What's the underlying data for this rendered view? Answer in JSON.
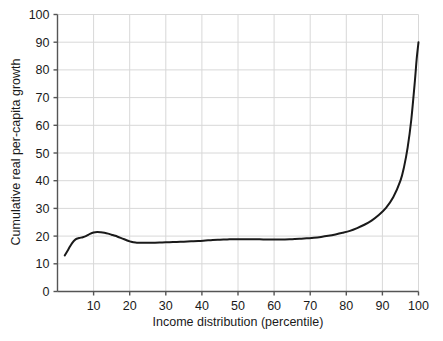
{
  "chart_data": {
    "type": "line",
    "title": "",
    "xlabel": "Income distribution (percentile)",
    "ylabel": "Cumulative real per-capita growth",
    "xlim": [
      0,
      100
    ],
    "ylim": [
      0,
      100
    ],
    "xticks": [
      10,
      20,
      30,
      40,
      50,
      60,
      70,
      80,
      90,
      100
    ],
    "yticks": [
      0,
      10,
      20,
      30,
      40,
      50,
      60,
      70,
      80,
      90,
      100
    ],
    "grid": true,
    "legend": "none",
    "line_color": "#1a1a1a",
    "grid_color": "#d8d8d8",
    "axis_color": "#555555",
    "background": "#ffffff",
    "series": [
      {
        "name": "Cumulative real per-capita growth",
        "x": [
          2,
          3,
          4,
          5,
          6,
          7,
          8,
          9,
          10,
          11,
          12,
          13,
          14,
          15,
          16,
          17,
          18,
          19,
          20,
          21,
          22,
          23,
          24,
          25,
          27,
          29,
          31,
          33,
          35,
          37,
          39,
          41,
          43,
          45,
          47,
          49,
          51,
          53,
          55,
          57,
          59,
          61,
          63,
          65,
          67,
          69,
          71,
          73,
          75,
          77,
          79,
          81,
          83,
          85,
          87,
          89,
          91,
          93,
          95,
          96,
          97,
          98,
          99,
          99.5,
          100
        ],
        "values": [
          13.0,
          15.2,
          17.4,
          18.8,
          19.3,
          19.6,
          20.1,
          20.8,
          21.3,
          21.5,
          21.4,
          21.2,
          20.9,
          20.5,
          20.1,
          19.6,
          19.1,
          18.6,
          18.1,
          17.8,
          17.6,
          17.6,
          17.6,
          17.6,
          17.6,
          17.7,
          17.8,
          17.9,
          18.0,
          18.1,
          18.2,
          18.4,
          18.6,
          18.7,
          18.8,
          18.9,
          18.9,
          18.9,
          18.9,
          18.8,
          18.8,
          18.8,
          18.8,
          18.9,
          19.0,
          19.2,
          19.4,
          19.7,
          20.1,
          20.6,
          21.2,
          21.9,
          22.9,
          24.1,
          25.6,
          27.6,
          30.2,
          34.0,
          40.0,
          45.0,
          52.0,
          62.0,
          76.0,
          84.0,
          90.0
        ]
      }
    ]
  },
  "axis": {
    "x_ticks_labels": [
      "10",
      "20",
      "30",
      "40",
      "50",
      "60",
      "70",
      "80",
      "90",
      "100"
    ],
    "y_ticks_labels": [
      "0",
      "10",
      "20",
      "30",
      "40",
      "50",
      "60",
      "70",
      "80",
      "90",
      "100"
    ],
    "x_title": "Income distribution (percentile)",
    "y_title": "Cumulative real per-capita growth"
  }
}
